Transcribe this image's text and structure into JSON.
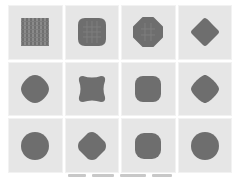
{
  "figure": {
    "rows": 3,
    "cols": 4,
    "panel_color": "#e6e6e6",
    "shape_color": "#6e6e6e",
    "panels": [
      {
        "shape": "square-checkered"
      },
      {
        "shape": "rounded-octagon"
      },
      {
        "shape": "octagon"
      },
      {
        "shape": "diamond-rounded"
      },
      {
        "shape": "rounded-diamond-blob"
      },
      {
        "shape": "squircle-pinched"
      },
      {
        "shape": "rounded-square"
      },
      {
        "shape": "rounded-diamond"
      },
      {
        "shape": "circle"
      },
      {
        "shape": "diamond-rounded"
      },
      {
        "shape": "rounded-square"
      },
      {
        "shape": "circle"
      }
    ]
  }
}
